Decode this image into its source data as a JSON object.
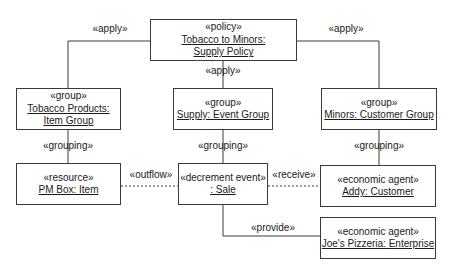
{
  "diagram": {
    "type": "UML object diagram (REA policy model)",
    "nodes": {
      "policy": {
        "stereotype": "«policy»",
        "name_line1": "Tobacco to Minors:",
        "name_line2": "Supply Policy"
      },
      "tobacco_group": {
        "stereotype": "«group»",
        "name_line1": "Tobacco Products:",
        "name_line2": "Item Group"
      },
      "supply_group": {
        "stereotype": "«group»",
        "name_line1": "Supply: Event Group"
      },
      "minors_group": {
        "stereotype": "«group»",
        "name_line1": "Minors: Customer Group"
      },
      "pm_box": {
        "stereotype": "«resource»",
        "name_line1": "PM Box: Item"
      },
      "sale": {
        "stereotype": "«decrement event»",
        "name_line1": ": Sale"
      },
      "addy": {
        "stereotype": "«economic agent»",
        "name_line1": "Addy: Customer"
      },
      "joes": {
        "stereotype": "«economic agent»",
        "name_line1": "Joe's Pizzeria: Enterprise"
      }
    },
    "edges": {
      "apply_left": {
        "label": "«apply»",
        "from": "policy",
        "to": "tobacco_group",
        "style": "solid"
      },
      "apply_center": {
        "label": "«apply»",
        "from": "policy",
        "to": "supply_group",
        "style": "solid"
      },
      "apply_right": {
        "label": "«apply»",
        "from": "policy",
        "to": "minors_group",
        "style": "solid"
      },
      "grouping_left": {
        "label": "«grouping»",
        "from": "tobacco_group",
        "to": "pm_box",
        "style": "solid"
      },
      "grouping_center": {
        "label": "«grouping»",
        "from": "supply_group",
        "to": "sale",
        "style": "solid"
      },
      "grouping_right": {
        "label": "«grouping»",
        "from": "minors_group",
        "to": "addy",
        "style": "solid"
      },
      "outflow": {
        "label": "«outflow»",
        "from": "pm_box",
        "to": "sale",
        "style": "dashed"
      },
      "receive": {
        "label": "«receive»",
        "from": "sale",
        "to": "addy",
        "style": "dashed"
      },
      "provide": {
        "label": "«provide»",
        "from": "sale",
        "to": "joes",
        "style": "solid"
      }
    },
    "colors": {
      "line": "#3a3a3a",
      "text": "#1a1a1a",
      "background": "#ffffff"
    }
  }
}
